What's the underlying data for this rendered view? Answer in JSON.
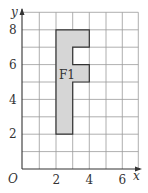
{
  "diagram": {
    "type": "coordinate-grid-shape",
    "axes": {
      "x_label": "x",
      "y_label": "y",
      "origin_label": "O",
      "x_range": [
        0,
        7
      ],
      "y_range": [
        0,
        9
      ],
      "x_ticks": [
        "2",
        "4",
        "6"
      ],
      "y_ticks": [
        "2",
        "4",
        "6",
        "8"
      ]
    },
    "grid": {
      "on": true,
      "spacing": 1,
      "color": "#9a9a9a"
    },
    "shape": {
      "label": "F1",
      "fill": "#d6d6d6",
      "stroke": "#333333",
      "vertices": [
        [
          2,
          2
        ],
        [
          3,
          2
        ],
        [
          3,
          5
        ],
        [
          4,
          5
        ],
        [
          4,
          6
        ],
        [
          3,
          6
        ],
        [
          3,
          7
        ],
        [
          4,
          7
        ],
        [
          4,
          8
        ],
        [
          2,
          8
        ]
      ]
    }
  }
}
